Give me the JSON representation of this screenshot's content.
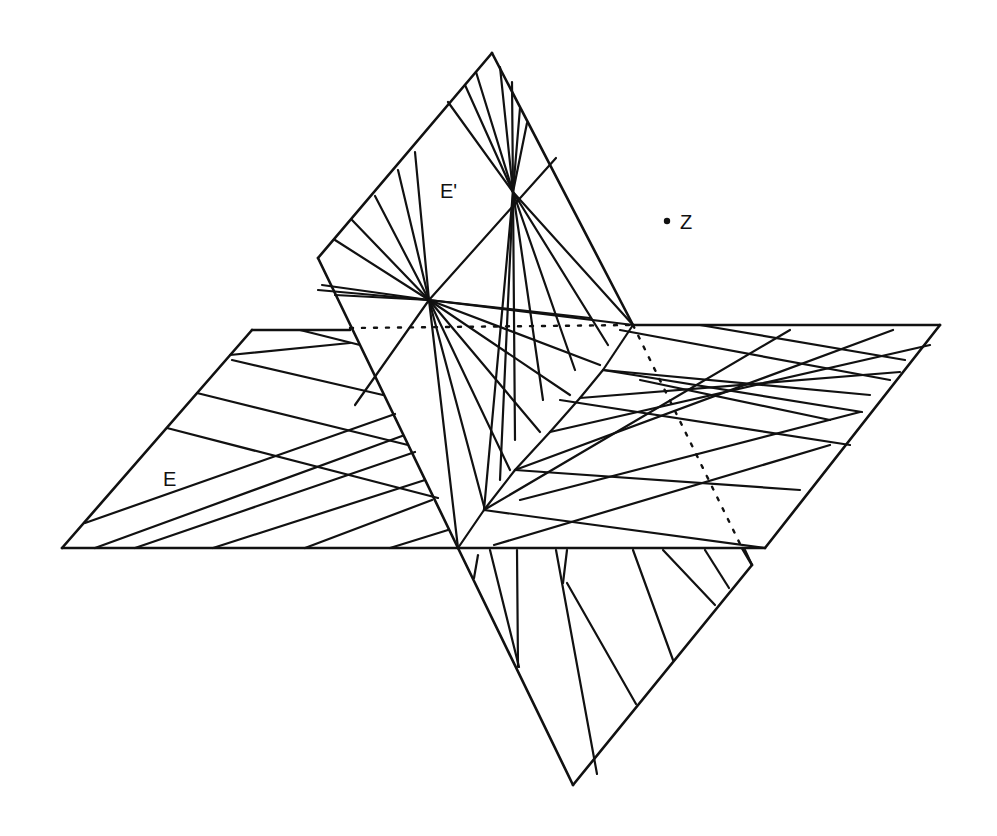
{
  "figure": {
    "type": "line-drawing",
    "colors": {
      "ink": "#111111",
      "paper": "#ffffff"
    }
  },
  "labels": {
    "plane_e": "E",
    "plane_e_prime": "E'",
    "point_z": "Z"
  },
  "planes": [
    {
      "id": "E",
      "name": "horizontal plane"
    },
    {
      "id": "E'",
      "name": "inclined plane"
    }
  ],
  "point": {
    "id": "Z",
    "marker": "dot"
  }
}
